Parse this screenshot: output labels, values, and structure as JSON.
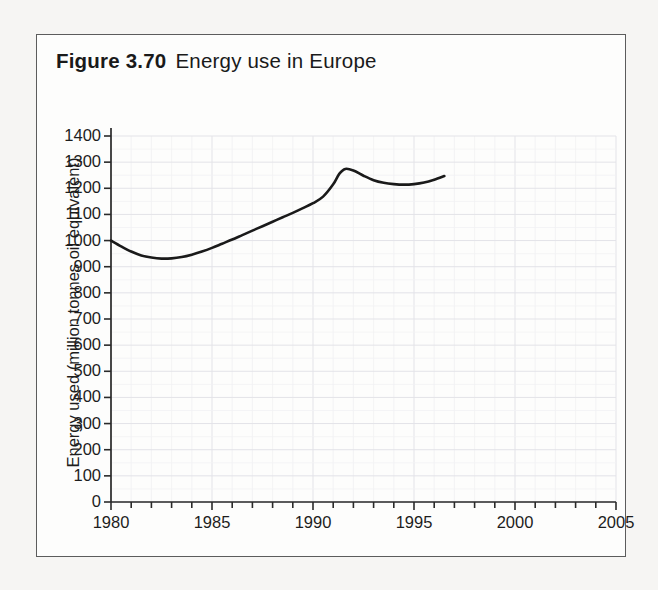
{
  "figure": {
    "number": "Figure 3.70",
    "caption": "Energy use in Europe",
    "border_color": "#5c5c5c",
    "background": "#fdfdfc",
    "page_background": "#f6f5f3"
  },
  "chart_data": {
    "type": "line",
    "xlabel": "",
    "ylabel": "Energy used (million tonnes oil equivalent)",
    "xlim": [
      1980,
      2005
    ],
    "ylim": [
      0,
      1400
    ],
    "ytick_step": 100,
    "xtick_step": 5,
    "x_minor_tick_step": 1,
    "grid": true,
    "grid_color": "#e9e9ec",
    "legend": null,
    "line_color": "#1a1a1a",
    "line_width": 2.6,
    "xticklabels": [
      "1980",
      "1985",
      "1990",
      "1995",
      "2000",
      "2005"
    ],
    "yticklabels": [
      "0",
      "100",
      "200",
      "300",
      "400",
      "500",
      "600",
      "700",
      "800",
      "900",
      "1000",
      "1100",
      "1200",
      "1300",
      "1400"
    ],
    "series": [
      {
        "name": "Energy used in Europe",
        "x": [
          1980,
          1980.5,
          1981,
          1981.5,
          1982,
          1982.5,
          1983,
          1983.5,
          1984,
          1984.5,
          1985,
          1985.5,
          1986,
          1986.5,
          1987,
          1987.5,
          1988,
          1988.5,
          1989,
          1989.5,
          1990,
          1990.5,
          1991,
          1991.3,
          1991.6,
          1992,
          1992.5,
          1993,
          1993.5,
          1994,
          1994.5,
          1995,
          1995.5,
          1996,
          1996.5
        ],
        "y": [
          1000,
          978,
          958,
          943,
          935,
          931,
          932,
          937,
          946,
          958,
          972,
          988,
          1004,
          1021,
          1038,
          1055,
          1072,
          1089,
          1106,
          1124,
          1143,
          1168,
          1215,
          1255,
          1274,
          1268,
          1248,
          1231,
          1221,
          1216,
          1214,
          1216,
          1222,
          1233,
          1247
        ]
      }
    ]
  },
  "axes": {
    "y_title": "Energy used (million tonnes oil equivalent)",
    "y_ticks": [
      {
        "label": "1400",
        "value": 1400
      },
      {
        "label": "1300",
        "value": 1300
      },
      {
        "label": "1200",
        "value": 1200
      },
      {
        "label": "1100",
        "value": 1100
      },
      {
        "label": "1000",
        "value": 1000
      },
      {
        "label": "900",
        "value": 900
      },
      {
        "label": "800",
        "value": 800
      },
      {
        "label": "700",
        "value": 700
      },
      {
        "label": "600",
        "value": 600
      },
      {
        "label": "500",
        "value": 500
      },
      {
        "label": "400",
        "value": 400
      },
      {
        "label": "300",
        "value": 300
      },
      {
        "label": "200",
        "value": 200
      },
      {
        "label": "100",
        "value": 100
      },
      {
        "label": "0",
        "value": 0
      }
    ],
    "x_ticks": [
      {
        "label": "1980",
        "value": 1980
      },
      {
        "label": "1985",
        "value": 1985
      },
      {
        "label": "1990",
        "value": 1990
      },
      {
        "label": "1995",
        "value": 1995
      },
      {
        "label": "2000",
        "value": 2000
      },
      {
        "label": "2005",
        "value": 2005
      }
    ]
  }
}
